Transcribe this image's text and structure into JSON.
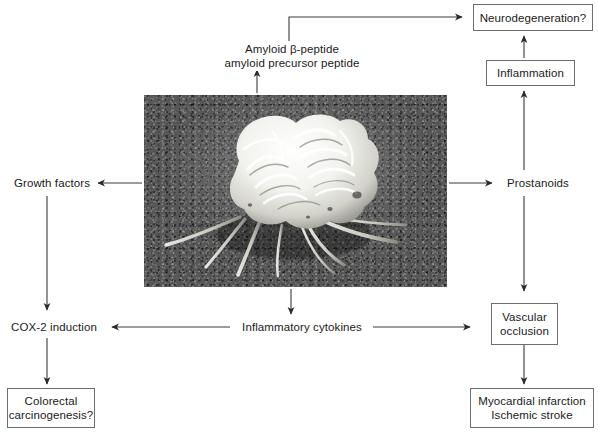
{
  "figure": {
    "type": "biological-pathway-diagram",
    "background_color": "#ffffff",
    "line_color": "#333333",
    "box_border_color": "#6e6e6e"
  },
  "center": {
    "image_caption": "",
    "image_alt": "scanning electron micrograph of an activated macrophage / microglial cell with extended filopodia on a granular substrate"
  },
  "nodes": {
    "amyloid": {
      "line1": "Amyloid β-peptide",
      "line2": "amyloid precursor peptide",
      "boxed": false
    },
    "neurodegeneration": {
      "line1": "Neurodegeneration?",
      "boxed": true
    },
    "inflammation": {
      "line1": "Inflammation",
      "boxed": true
    },
    "prostanoids": {
      "line1": "Prostanoids",
      "boxed": false
    },
    "growth_factors": {
      "line1": "Growth factors",
      "boxed": false
    },
    "cox2_induction": {
      "line1": "COX-2 induction",
      "boxed": false
    },
    "colorectal": {
      "line1": "Colorectal",
      "line2": "carcinogenesis?",
      "boxed": true
    },
    "inflammatory_cytokines": {
      "line1": "Inflammatory cytokines",
      "boxed": false
    },
    "vascular_occlusion": {
      "line1": "Vascular",
      "line2": "occlusion",
      "boxed": true
    },
    "myocardial": {
      "line1": "Myocardial infarction",
      "line2": "Ischemic stroke",
      "boxed": true
    }
  },
  "edges": [
    {
      "name": "cell-to-amyloid",
      "from": "cell-image",
      "to": "amyloid",
      "direction": "up",
      "arrowhead": true
    },
    {
      "name": "amyloid-to-neurodegeneration",
      "from": "amyloid",
      "to": "neurodegeneration",
      "direction": "up-then-right",
      "arrowhead": true
    },
    {
      "name": "inflammation-to-neurodegeneration",
      "from": "inflammation",
      "to": "neurodegeneration",
      "direction": "up",
      "arrowhead": true
    },
    {
      "name": "prostanoids-to-inflammation",
      "from": "prostanoids",
      "to": "inflammation",
      "direction": "up",
      "arrowhead": true
    },
    {
      "name": "cell-to-prostanoids",
      "from": "cell-image",
      "to": "prostanoids",
      "direction": "right",
      "arrowhead": true
    },
    {
      "name": "prostanoids-to-vascular-occlusion",
      "from": "prostanoids",
      "to": "vascular-occlusion",
      "direction": "down",
      "arrowhead": true
    },
    {
      "name": "vascular-occlusion-to-myocardial",
      "from": "vascular-occlusion",
      "to": "myocardial",
      "direction": "down",
      "arrowhead": true
    },
    {
      "name": "cell-to-growth-factors",
      "from": "cell-image",
      "to": "growth-factors",
      "direction": "left",
      "arrowhead": true
    },
    {
      "name": "growth-factors-to-cox2",
      "from": "growth-factors",
      "to": "cox2-induction",
      "direction": "down",
      "arrowhead": true
    },
    {
      "name": "cox2-to-colorectal",
      "from": "cox2-induction",
      "to": "colorectal",
      "direction": "down",
      "arrowhead": true
    },
    {
      "name": "cell-to-inflammatory-cytokines",
      "from": "cell-image",
      "to": "inflammatory-cytokines",
      "direction": "down",
      "arrowhead": true
    },
    {
      "name": "inflammatory-cytokines-to-cox2",
      "from": "inflammatory-cytokines",
      "to": "cox2-induction",
      "direction": "left",
      "arrowhead": true
    },
    {
      "name": "inflammatory-cytokines-to-vascular-occlusion",
      "from": "inflammatory-cytokines",
      "to": "vascular-occlusion",
      "direction": "right",
      "arrowhead": true
    }
  ]
}
